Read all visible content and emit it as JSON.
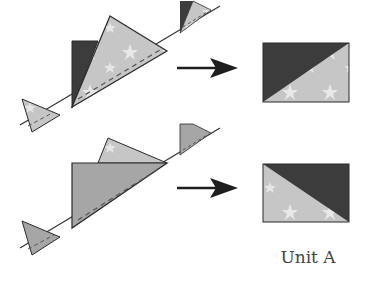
{
  "diagram": {
    "type": "quilt-piecing-steps",
    "steps": [
      {
        "id": "top",
        "description": "Light star triangle sewn onto dark triangle along diagonal seam",
        "result": "dark top-left, star fabric bottom-right"
      },
      {
        "id": "bottom",
        "description": "Medium gray triangle sewn onto star triangle along diagonal seam",
        "result": "star fabric bottom-left, dark top-right"
      }
    ],
    "caption": "Unit A",
    "colors": {
      "dark": "#3c3c3c",
      "star_light": "#c8c8c8",
      "star_highlight": "#ececec",
      "medium": "#a6a6a6",
      "outline": "#2a2a2a",
      "arrow": "#1e1e1e"
    }
  }
}
